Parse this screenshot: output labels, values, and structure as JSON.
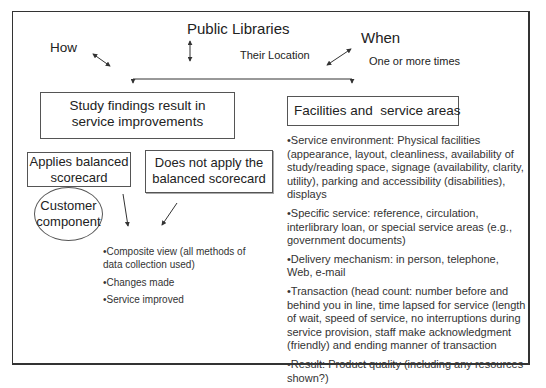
{
  "header": {
    "public_libraries": "Public Libraries",
    "how": "How",
    "their_location": "Their Location",
    "when": "When",
    "one_or_more_times": "One or more times"
  },
  "left_branch": {
    "main_box": [
      "Study findings result in",
      "service improvements"
    ],
    "applies_box": [
      "Applies balanced",
      "scorecard"
    ],
    "not_apply_box": [
      "Does not apply the",
      "balanced scorecard"
    ],
    "customer_ellipse": [
      "Customer",
      "component"
    ],
    "outcomes": [
      "•Composite view (all methods of data collection used)",
      "•Changes made",
      "•Service improved"
    ]
  },
  "right_branch": {
    "main_box": "Facilities and  service areas",
    "items": [
      "•Service environment: Physical facilities (appearance, layout, cleanliness, availability of study/reading space, signage (availability, clarity, utility), parking and accessibility (disabilities), displays",
      "•Specific service: reference, circulation, interlibrary loan, or special service areas (e.g., government documents)",
      "•Delivery mechanism: in person, telephone, Web, e-mail",
      "•Transaction (head count: number before and behind you in line, time lapsed for service (length of wait, speed of service, no interruptions during service provision, staff make acknowledgment (friendly) and ending manner of transaction",
      "•Result: Product quality (including any resources shown?)"
    ]
  }
}
